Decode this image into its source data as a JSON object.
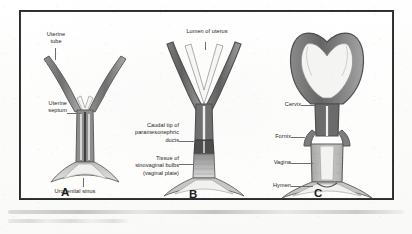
{
  "figure": {
    "panels": [
      {
        "id": "A",
        "letter": "A",
        "labels": [
          {
            "name": "uterine-tube",
            "lines": [
              "Uterine",
              "tube"
            ]
          },
          {
            "name": "uterine-septum",
            "lines": [
              "Uterine",
              "septum"
            ]
          },
          {
            "name": "urogenital-sinus",
            "lines": [
              "Urogenital sinus"
            ]
          }
        ]
      },
      {
        "id": "B",
        "letter": "B",
        "labels": [
          {
            "name": "lumen-of-uterus",
            "lines": [
              "Lumen of uterus"
            ]
          },
          {
            "name": "caudal-tip-of-paramesonephric-ducts",
            "lines": [
              "Caudal tip of",
              "paramesonephric",
              "ducts"
            ]
          },
          {
            "name": "tissue-of-sinovaginal-bulbs",
            "lines": [
              "Tissue of",
              "sinovaginal bulbs",
              "(vaginal plate)"
            ]
          }
        ]
      },
      {
        "id": "C",
        "letter": "C",
        "labels": [
          {
            "name": "cervix",
            "lines": [
              "Cervix"
            ]
          },
          {
            "name": "fornix",
            "lines": [
              "Fornix"
            ]
          },
          {
            "name": "vagina",
            "lines": [
              "Vagina"
            ]
          },
          {
            "name": "hymen",
            "lines": [
              "Hymen"
            ]
          }
        ]
      }
    ],
    "caption": {
      "line1": "",
      "line2": ""
    },
    "colors": {
      "frame": "#2b2b2b",
      "label_text": "#3a3a3a",
      "leader": "#6e6e6e",
      "outline_dark": "#5d5d5d",
      "tissue_mid": "#9a9a9a",
      "tissue_light": "#c9c9c9",
      "lumen_fill": "#f2f2f0",
      "page": "#ffffff"
    }
  }
}
